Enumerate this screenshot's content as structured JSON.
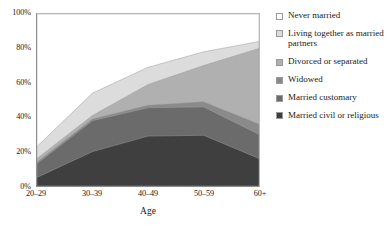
{
  "chart_data": {
    "type": "area",
    "title": "",
    "subtitle": "",
    "xlabel": "Age",
    "ylabel": "",
    "categories": [
      "20–29",
      "30–39",
      "40–49",
      "50–59",
      "60+"
    ],
    "ylim": [
      0,
      100
    ],
    "ytick_labels": [
      "0%",
      "20%",
      "40%",
      "60%",
      "80%",
      "100%"
    ],
    "ytick_values": [
      0,
      20,
      40,
      60,
      80,
      100
    ],
    "grid": false,
    "stacked": true,
    "stack_order_bottom_to_top": [
      "Married civil or religious",
      "Married customary",
      "Widowed",
      "Divorced or separated",
      "Living together as married partners",
      "Never married"
    ],
    "legend_position": "right",
    "series": [
      {
        "name": "Never married",
        "color": "#ffffff",
        "values": [
          77,
          46,
          31,
          22,
          16
        ],
        "cumulative_top": [
          100,
          100,
          100,
          100,
          100
        ]
      },
      {
        "name": "Living together as married partners",
        "color": "#dcdcdc",
        "values": [
          7,
          13,
          10,
          8,
          4
        ],
        "cumulative_top": [
          23,
          54,
          69,
          78,
          84
        ]
      },
      {
        "name": "Divorced or separated",
        "color": "#b0b0b0",
        "values": [
          2,
          2,
          12,
          21,
          44
        ],
        "cumulative_top": [
          16,
          41,
          59,
          70,
          80
        ]
      },
      {
        "name": "Widowed",
        "color": "#8a8a8a",
        "values": [
          1,
          1,
          1.5,
          3,
          6
        ],
        "cumulative_top": [
          14,
          39,
          47,
          49,
          36
        ]
      },
      {
        "name": "Married customary",
        "color": "#6b6b6b",
        "values": [
          8,
          18,
          16.5,
          16.5,
          14
        ],
        "cumulative_top": [
          13,
          38,
          45.5,
          46,
          30
        ]
      },
      {
        "name": "Married civil or religious",
        "color": "#3f3f3f",
        "values": [
          5,
          20,
          29,
          29.5,
          16
        ],
        "cumulative_top": [
          5,
          20,
          29,
          29.5,
          16
        ]
      }
    ]
  },
  "legend": {
    "items": [
      {
        "label": "Never married",
        "color": "#ffffff"
      },
      {
        "label": "Living together as married partners",
        "color": "#dcdcdc"
      },
      {
        "label": "Divorced or separated",
        "color": "#b0b0b0"
      },
      {
        "label": "Widowed",
        "color": "#8a8a8a"
      },
      {
        "label": "Married customary",
        "color": "#6b6b6b"
      },
      {
        "label": "Married civil or religious",
        "color": "#3f3f3f"
      }
    ]
  }
}
